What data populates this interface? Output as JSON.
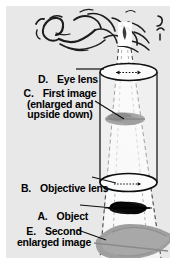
{
  "figure": {
    "background_color": "#e8e8e8",
    "ink_color": "#000000",
    "labels": [
      {
        "key": "D",
        "letter": "D.",
        "text": "Eye lens",
        "lines": [
          "Eye lens"
        ]
      },
      {
        "key": "C",
        "letter": "C.",
        "text": "First image (enlarged and upside down)",
        "lines": [
          "First image",
          "(enlarged and",
          "upside down)"
        ]
      },
      {
        "key": "B",
        "letter": "B.",
        "text": "Objective lens",
        "lines": [
          "Objective lens"
        ]
      },
      {
        "key": "A",
        "letter": "A.",
        "text": "Object",
        "lines": [
          "Object"
        ]
      },
      {
        "key": "E",
        "letter": "E.",
        "text": "Second enlarged image",
        "lines": [
          "Second",
          "enlarged image"
        ]
      }
    ],
    "parts": {
      "observer": "sketch of a person's head and eye looking into the microscope",
      "tube": "vertical microscope barrel cylinder",
      "eye_lens": "ellipse at top of barrel with small dotted double arrow",
      "objective_lens": "ellipse at bottom of barrel with small arrow",
      "first_image": "small gray feather smudge inside the barrel",
      "object": "small black feather below the objective lens",
      "second_image": "large gray feather at the bottom",
      "light_cone": "dashed white cone widening downward from the eye"
    },
    "colors": {
      "panel": "#e8e8e8",
      "cone": "#fbfbfb",
      "feather_gray": "#9a9a9a",
      "feather_black": "#121212",
      "barrel": "#f4f4f4"
    }
  }
}
